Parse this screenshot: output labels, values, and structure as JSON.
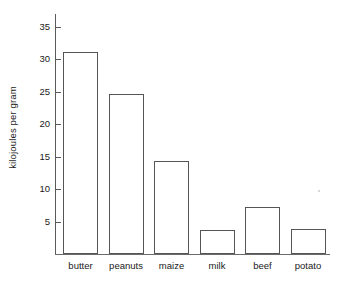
{
  "chart_data": {
    "type": "bar",
    "title": "",
    "xlabel": "",
    "ylabel": "kilojoules per gram",
    "categories": [
      "butter",
      "peanuts",
      "maize",
      "milk",
      "beef",
      "potato"
    ],
    "values": [
      31.2,
      24.7,
      14.3,
      3.7,
      7.3,
      3.8
    ],
    "ylim": [
      0,
      37
    ],
    "yticks": [
      5,
      10,
      15,
      20,
      25,
      30,
      35
    ],
    "ytick_labels": [
      "5",
      "10",
      "15",
      "20",
      "25",
      "30",
      "35"
    ],
    "grid": false,
    "legend": null,
    "bar_fill": "#ffffff",
    "bar_edge": "#555555",
    "axis_color": "#5a5a5a",
    "text_color": "#1a1a1a",
    "background": "#ffffff"
  }
}
